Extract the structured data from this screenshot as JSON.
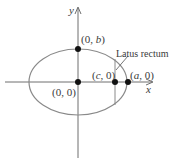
{
  "diagram": {
    "type": "ellipse-latus-rectum",
    "axes": {
      "x_label": "x",
      "y_label": "y"
    },
    "points": [
      {
        "id": "origin",
        "label": "(0, 0)",
        "pre": "(0, 0)",
        "var": "",
        "post": ""
      },
      {
        "id": "covertex",
        "label": "(0, b)",
        "pre": "(0, ",
        "var": "b",
        "post": ")"
      },
      {
        "id": "focus",
        "label": "(c, 0)",
        "pre": "(",
        "var": "c",
        "post": ", 0)"
      },
      {
        "id": "vertex",
        "label": "(a, 0)",
        "pre": "(",
        "var": "a",
        "post": ", 0)"
      }
    ],
    "annotation": "Latus rectum",
    "colors": {
      "line": "#6e6e6e",
      "ellipse": "#8a8a8a",
      "point": "#111111",
      "text": "#3a3a3a"
    }
  }
}
